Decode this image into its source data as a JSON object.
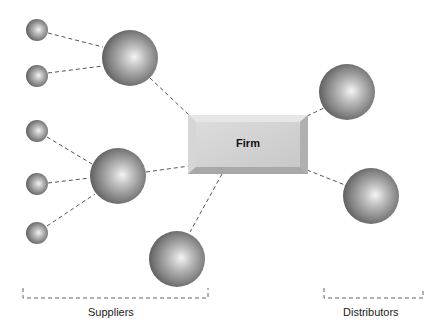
{
  "diagram": {
    "center": {
      "label": "Firm"
    },
    "groups": [
      {
        "label": "Suppliers"
      },
      {
        "label": "Distributors"
      }
    ],
    "nodes": [
      {
        "id": "s1",
        "type": "small",
        "cx": 37,
        "cy": 30,
        "r": 11
      },
      {
        "id": "s2",
        "type": "small",
        "cx": 37,
        "cy": 76,
        "r": 11
      },
      {
        "id": "s3",
        "type": "small",
        "cx": 37,
        "cy": 131,
        "r": 11
      },
      {
        "id": "s4",
        "type": "small",
        "cx": 37,
        "cy": 184,
        "r": 11
      },
      {
        "id": "s5",
        "type": "small",
        "cx": 37,
        "cy": 233,
        "r": 11
      },
      {
        "id": "L1",
        "type": "large",
        "cx": 130,
        "cy": 58,
        "r": 28
      },
      {
        "id": "L2",
        "type": "large",
        "cx": 118,
        "cy": 176,
        "r": 28
      },
      {
        "id": "L3",
        "type": "large",
        "cx": 177,
        "cy": 259,
        "r": 28
      },
      {
        "id": "D1",
        "type": "large",
        "cx": 347,
        "cy": 92,
        "r": 28
      },
      {
        "id": "D2",
        "type": "large",
        "cx": 371,
        "cy": 196,
        "r": 28
      }
    ]
  }
}
